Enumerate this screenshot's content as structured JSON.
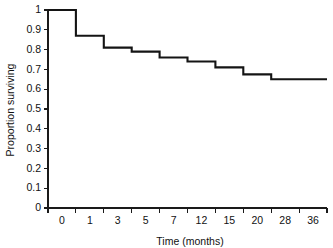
{
  "chart_data": {
    "type": "line",
    "title": "",
    "xlabel": "Time (months)",
    "ylabel": "Proportion surviving",
    "categories": [
      "0",
      "1",
      "3",
      "5",
      "7",
      "12",
      "15",
      "20",
      "28",
      "36"
    ],
    "values": [
      1.0,
      0.87,
      0.81,
      0.79,
      0.76,
      0.74,
      0.71,
      0.675,
      0.65,
      0.65
    ],
    "series": [
      {
        "name": "Proportion surviving",
        "values": [
          1.0,
          0.87,
          0.81,
          0.79,
          0.76,
          0.74,
          0.71,
          0.675,
          0.65,
          0.65
        ]
      }
    ],
    "step_style": "post",
    "ylim": [
      0,
      1
    ],
    "ytick_labels": [
      "0",
      "0.1",
      "0.2",
      "0.3",
      "0.4",
      "0.5",
      "0.6",
      "0.7",
      "0.8",
      "0.9",
      "1"
    ],
    "ytick_values": [
      0,
      0.1,
      0.2,
      0.3,
      0.4,
      0.5,
      0.6,
      0.7,
      0.8,
      0.9,
      1
    ],
    "grid": false,
    "legend": false,
    "legend_position": "none",
    "line_color": "#141414",
    "axis_color": "#1a1a1a",
    "background_color": "#ffffff"
  },
  "axes": {
    "x_title": "Time (months)",
    "y_title": "Proportion surviving"
  }
}
